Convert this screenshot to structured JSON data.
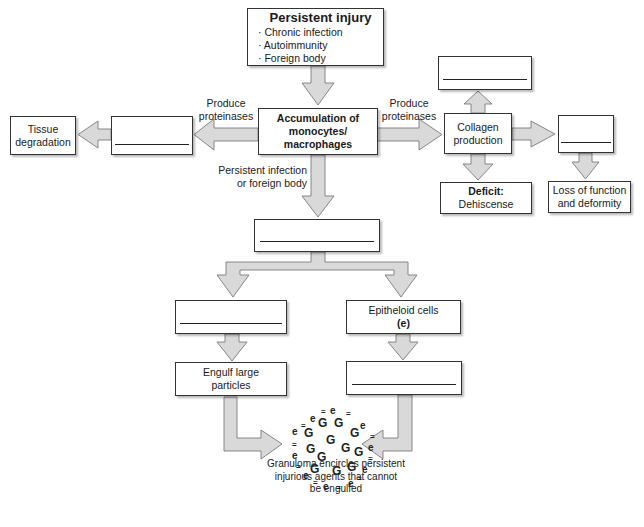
{
  "diagram": {
    "colors": {
      "arrow_fill": "#d9d9d9",
      "arrow_stroke": "#7a7a7a",
      "box_border": "#333333",
      "background": "#ffffff"
    },
    "nodes": {
      "persistent_injury": {
        "title": "Persistent injury",
        "bullets": [
          "Chronic infection",
          "Autoimmunity",
          "Foreign body"
        ]
      },
      "accumulation": {
        "lines": [
          "Accumulation of",
          "monocytes/",
          "macrophages"
        ]
      },
      "left_blank": {
        "text": "",
        "blank": true
      },
      "tissue_degradation": {
        "lines": [
          "Tissue",
          "degradation"
        ]
      },
      "collagen": {
        "lines": [
          "Collagen",
          "production"
        ]
      },
      "collagen_top_blank": {
        "text": "",
        "blank": true
      },
      "collagen_right_blank": {
        "text": "",
        "blank": true
      },
      "deficit": {
        "title": "Deficit:",
        "text": "Dehiscense"
      },
      "loss_function": {
        "lines": [
          "Loss of function",
          "and deformity"
        ]
      },
      "middle_blank": {
        "text": "",
        "blank": true
      },
      "left_branch_blank": {
        "text": "",
        "blank": true
      },
      "epitheloid": {
        "line1": "Epitheloid cells",
        "line2": "(e)"
      },
      "engulf": {
        "lines": [
          "Engulf large",
          "particles"
        ]
      },
      "right_branch_blank": {
        "text": "",
        "blank": true
      }
    },
    "edge_labels": {
      "left_proteinases": [
        "Produce",
        "proteinases"
      ],
      "right_proteinases": [
        "Produce",
        "proteinases"
      ],
      "persistent": [
        "Persistent infection",
        "or foreign body"
      ]
    },
    "granuloma": {
      "center_symbol": "G",
      "ring_symbol": "e",
      "ring_separator": "=",
      "caption": [
        "Granuloma encircles persistent",
        "injurious agents that cannot",
        "be engulfed"
      ]
    }
  }
}
